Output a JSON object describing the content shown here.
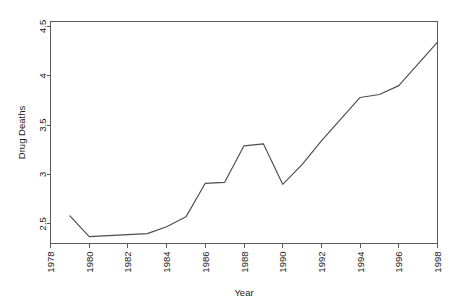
{
  "chart_data": {
    "type": "line",
    "title": "",
    "subtitle": "",
    "xlabel": "Year",
    "ylabel": "Drug Deaths",
    "xlim": [
      1978,
      1998
    ],
    "ylim": [
      2.3,
      4.55
    ],
    "grid": false,
    "legend": null,
    "xticks": [
      1978,
      1980,
      1982,
      1984,
      1986,
      1988,
      1990,
      1992,
      1994,
      1996,
      1998
    ],
    "xtick_labels": [
      "1978",
      "1980",
      "1982",
      "1984",
      "1986",
      "1988",
      "1990",
      "1992",
      "1994",
      "1996",
      "1998"
    ],
    "yticks": [
      2.5,
      3,
      3.5,
      4,
      4.5
    ],
    "ytick_labels": [
      "2.5",
      "3",
      "3.5",
      "4",
      "4.5"
    ],
    "line_color": "#4d4d4d",
    "frame_color": "#5a5a5a",
    "background": "#ffffff",
    "x": [
      1979,
      1980,
      1981,
      1982,
      1983,
      1984,
      1985,
      1986,
      1987,
      1988,
      1989,
      1990,
      1991,
      1992,
      1993,
      1994,
      1995,
      1996,
      1997,
      1998
    ],
    "values": [
      2.58,
      2.37,
      2.38,
      2.39,
      2.4,
      2.47,
      2.57,
      2.91,
      2.92,
      3.29,
      3.31,
      2.9,
      3.1,
      3.34,
      3.56,
      3.78,
      3.81,
      3.9,
      4.12,
      4.34
    ],
    "series": [
      {
        "name": "Drug Deaths",
        "values": [
          2.58,
          2.37,
          2.38,
          2.39,
          2.4,
          2.47,
          2.57,
          2.91,
          2.92,
          3.29,
          3.31,
          2.9,
          3.1,
          3.34,
          3.56,
          3.78,
          3.81,
          3.9,
          4.12,
          4.34
        ]
      }
    ]
  }
}
